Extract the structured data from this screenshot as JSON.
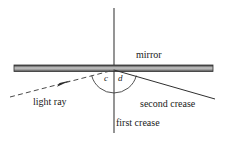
{
  "figure": {
    "background_color": "#ffffff",
    "line_color": "#2b2b2b",
    "text_color": "#1a1a1a",
    "width": 227,
    "height": 146
  },
  "labels": {
    "mirror": "mirror",
    "light_ray": "light ray",
    "second_crease": "second crease",
    "first_crease": "first crease",
    "angle_c": "c",
    "angle_d": "d"
  },
  "geometry": {
    "intersection_point": [
      114,
      70
    ],
    "mirror_bar": {
      "x1": 14,
      "x2": 213,
      "y_top": 65,
      "y_bottom": 71,
      "fill_top_color": "#3a3a3a",
      "fill_mid_color": "#c8c8c8",
      "fill_bottom_color": "#555555"
    },
    "first_crease_line": {
      "x": 114,
      "y1": 8,
      "y2": 133,
      "style": "solid"
    },
    "light_ray_line": {
      "x1": 10,
      "y1": 97,
      "x2": 114,
      "y2": 70,
      "style": "dashed"
    },
    "light_ray_arrow": {
      "x": 64,
      "y": 84,
      "direction": "up-right"
    },
    "second_crease_line": {
      "x1": 114,
      "y1": 70,
      "x2": 215,
      "y2": 99,
      "style": "solid"
    },
    "angle_arc": {
      "center": [
        114,
        70
      ],
      "radius": 23,
      "start_angle_deg": 194,
      "end_angle_deg": 346
    }
  }
}
